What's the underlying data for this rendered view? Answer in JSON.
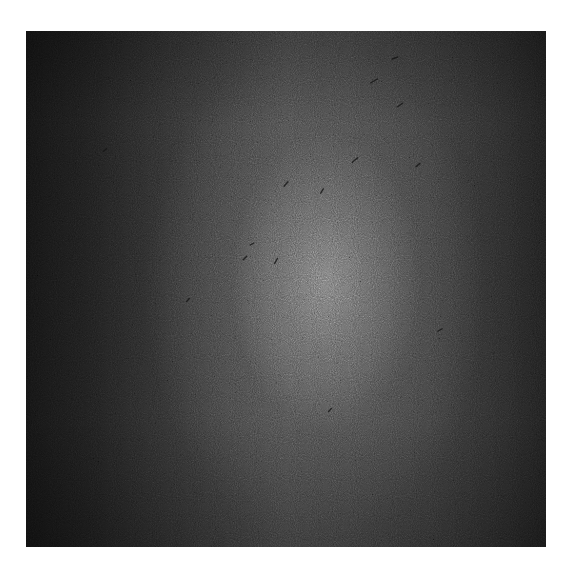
{
  "image": {
    "kind": "grayscale noisy texture photograph",
    "description": "Dark grainy surface with a brighter diffuse central region and darker left edge, scattered dark specks",
    "colors": {
      "background": "#ffffff",
      "dark_edge": "#141414",
      "mid_tone": "#4a4a4a",
      "highlight": "#7d7d7d"
    },
    "specks": [
      {
        "x": 374,
        "y": 81,
        "len": 8,
        "angle": -30
      },
      {
        "x": 395,
        "y": 58,
        "len": 6,
        "angle": -20
      },
      {
        "x": 355,
        "y": 160,
        "len": 7,
        "angle": -40
      },
      {
        "x": 322,
        "y": 191,
        "len": 5,
        "angle": -60
      },
      {
        "x": 286,
        "y": 184,
        "len": 6,
        "angle": -50
      },
      {
        "x": 276,
        "y": 261,
        "len": 6,
        "angle": -60
      },
      {
        "x": 245,
        "y": 258,
        "len": 5,
        "angle": -45
      },
      {
        "x": 252,
        "y": 244,
        "len": 4,
        "angle": -30
      },
      {
        "x": 400,
        "y": 105,
        "len": 6,
        "angle": -35
      },
      {
        "x": 418,
        "y": 165,
        "len": 5,
        "angle": -40
      },
      {
        "x": 188,
        "y": 300,
        "len": 4,
        "angle": -50
      },
      {
        "x": 105,
        "y": 150,
        "len": 4,
        "angle": -40
      },
      {
        "x": 330,
        "y": 410,
        "len": 4,
        "angle": -45
      },
      {
        "x": 440,
        "y": 330,
        "len": 5,
        "angle": -30
      }
    ]
  }
}
